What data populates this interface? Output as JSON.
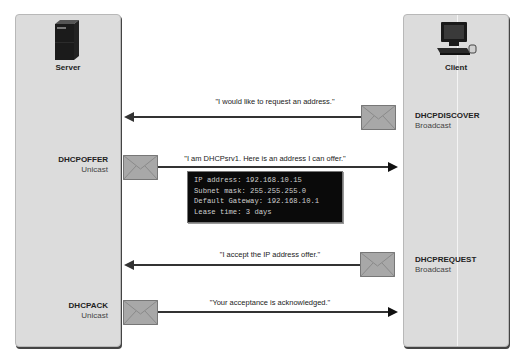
{
  "devices": {
    "server": {
      "label": "Server",
      "icon": "server-tower-icon"
    },
    "client": {
      "label": "Client",
      "icon": "desktop-computer-icon"
    }
  },
  "messages": [
    {
      "type": "DHCPDISCOVER",
      "mode": "Broadcast",
      "direction": "client-to-server",
      "text": "\"I would like to request an address.\""
    },
    {
      "type": "DHCPOFFER",
      "mode": "Unicast",
      "direction": "server-to-client",
      "text": "\"I am DHCPsrv1. Here is an address I can offer.\"",
      "details": [
        "IP address: 192.168.10.15",
        "Subnet mask: 255.255.255.0",
        "Default Gateway: 192.168.10.1",
        "Lease time: 3 days"
      ]
    },
    {
      "type": "DHCPREQUEST",
      "mode": "Broadcast",
      "direction": "client-to-server",
      "text": "\"I accept the IP address offer.\""
    },
    {
      "type": "DHCPACK",
      "mode": "Unicast",
      "direction": "server-to-client",
      "text": "\"Your acceptance is acknowledged.\""
    }
  ],
  "colors": {
    "panel": "#dcdcdc",
    "arrow": "#333333",
    "envelope": "#a9a9a9",
    "terminal_bg": "#0a0a0a",
    "terminal_text": "#cfcfcf"
  }
}
